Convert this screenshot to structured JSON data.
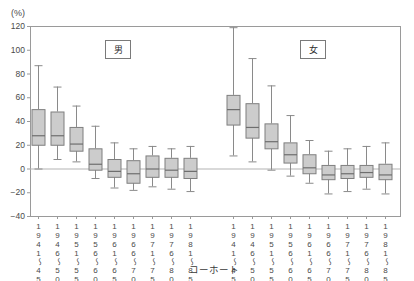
{
  "axis": {
    "unit_label": "(%)",
    "x_title": "コーホート",
    "y_ticks": [
      "120",
      "100",
      "80",
      "60",
      "40",
      "20",
      "0",
      "-20",
      "-40"
    ],
    "x_tick_labels": [
      "1941～45",
      "1946～50",
      "1951～55",
      "1956～60",
      "1961～65",
      "1966～70",
      "1971～75",
      "1976～80",
      "1981～85"
    ]
  },
  "groups": [
    {
      "label": "男"
    },
    {
      "label": "女"
    }
  ],
  "colors": {
    "box_fill": "#cccccc",
    "box_stroke": "#7f7f7f",
    "whisker": "#8a8a8a",
    "median": "#6e6e6e",
    "frame": "#9a9a9a",
    "zero_line": "#b3b3b3",
    "text": "#4a4a4a"
  },
  "chart_data": {
    "type": "box",
    "title": "",
    "subtitle": "",
    "xlabel": "コーホート",
    "ylabel": "(%)",
    "ylim": [
      -40,
      120
    ],
    "ytick_step": 20,
    "grid": false,
    "legend": "inline-panel-labels",
    "reference_lines": [
      0
    ],
    "categories": [
      "1941～45",
      "1946～50",
      "1951～55",
      "1956～60",
      "1961～65",
      "1966～70",
      "1971～75",
      "1976～80",
      "1981～85"
    ],
    "series": [
      {
        "name": "男",
        "boxes": [
          {
            "category": "1941～45",
            "min": 0,
            "q1": 20,
            "median": 28,
            "q3": 50,
            "max": 87
          },
          {
            "category": "1946～50",
            "min": 8,
            "q1": 20,
            "median": 28,
            "q3": 48,
            "max": 69
          },
          {
            "category": "1951～55",
            "min": 6,
            "q1": 15,
            "median": 21,
            "q3": 35,
            "max": 53
          },
          {
            "category": "1956～60",
            "min": -8,
            "q1": -1,
            "median": 4,
            "q3": 17,
            "max": 36
          },
          {
            "category": "1961～65",
            "min": -16,
            "q1": -7,
            "median": -2,
            "q3": 8,
            "max": 22
          },
          {
            "category": "1966～70",
            "min": -18,
            "q1": -12,
            "median": -4,
            "q3": 7,
            "max": 17
          },
          {
            "category": "1971～75",
            "min": -15,
            "q1": -7,
            "median": 0,
            "q3": 11,
            "max": 19
          },
          {
            "category": "1976～80",
            "min": -17,
            "q1": -7,
            "median": -1,
            "q3": 9,
            "max": 17
          },
          {
            "category": "1981～85",
            "min": -19,
            "q1": -8,
            "median": -2,
            "q3": 9,
            "max": 19
          }
        ]
      },
      {
        "name": "女",
        "boxes": [
          {
            "category": "1941～45",
            "min": 11,
            "q1": 37,
            "median": 50,
            "q3": 62,
            "max": 119
          },
          {
            "category": "1946～50",
            "min": 6,
            "q1": 26,
            "median": 35,
            "q3": 55,
            "max": 93
          },
          {
            "category": "1951～55",
            "min": -1,
            "q1": 17,
            "median": 23,
            "q3": 38,
            "max": 70
          },
          {
            "category": "1956～60",
            "min": -6,
            "q1": 5,
            "median": 12,
            "q3": 22,
            "max": 45
          },
          {
            "category": "1961～65",
            "min": -12,
            "q1": -4,
            "median": 1,
            "q3": 12,
            "max": 24
          },
          {
            "category": "1966～70",
            "min": -21,
            "q1": -9,
            "median": -5,
            "q3": 3,
            "max": 15
          },
          {
            "category": "1971～75",
            "min": -19,
            "q1": -8,
            "median": -4,
            "q3": 3,
            "max": 17
          },
          {
            "category": "1976～80",
            "min": -17,
            "q1": -7,
            "median": -3,
            "q3": 3,
            "max": 19
          },
          {
            "category": "1981～85",
            "min": -21,
            "q1": -9,
            "median": -5,
            "q3": 4,
            "max": 22
          }
        ]
      }
    ]
  }
}
